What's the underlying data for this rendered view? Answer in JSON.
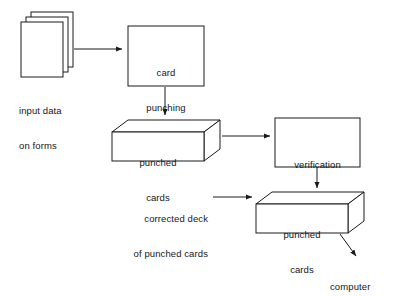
{
  "diagram": {
    "background_color": "#ffffff",
    "stroke_color": "#1a1a1a",
    "text_color": "#161616",
    "nodes": {
      "input_forms": {
        "icon": "stacked-documents-icon",
        "label_line1": "input data",
        "label_line2": "on forms"
      },
      "card_punching": {
        "shape": "rectangle",
        "label_line1": "card",
        "label_line2": "punching"
      },
      "punched_cards_1": {
        "shape": "cuboid",
        "label_line1": "punched",
        "label_line2": "cards"
      },
      "verification": {
        "shape": "rectangle",
        "label": "verification"
      },
      "punched_cards_2": {
        "shape": "cuboid",
        "label_line1": "punched",
        "label_line2": "cards"
      }
    },
    "annotations": {
      "corrected_deck_line1": "corrected deck",
      "corrected_deck_line2": "of punched cards",
      "computer": "computer"
    },
    "edges": [
      {
        "id": "forms-to-punching",
        "from": "input_forms",
        "to": "card_punching",
        "arrow": true
      },
      {
        "id": "punching-to-cards1",
        "from": "card_punching",
        "to": "punched_cards_1",
        "arrow": true
      },
      {
        "id": "cards1-to-verification",
        "from": "punched_cards_1",
        "to": "verification",
        "arrow": true
      },
      {
        "id": "verification-to-cards2",
        "from": "verification",
        "to": "punched_cards_2",
        "arrow": true
      },
      {
        "id": "corrected-deck-to-cards2",
        "from": "corrected_deck_label",
        "to": "punched_cards_2",
        "arrow": true
      },
      {
        "id": "cards2-to-computer",
        "from": "punched_cards_2",
        "to": "computer_label",
        "arrow": true
      }
    ]
  }
}
